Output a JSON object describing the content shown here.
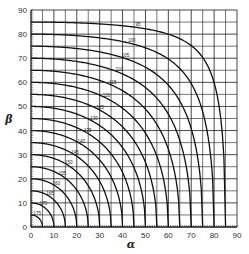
{
  "chart_data": {
    "type": "line",
    "title": "",
    "xlabel": "α",
    "ylabel": "β",
    "xlim": [
      0,
      90
    ],
    "ylim": [
      0,
      90
    ],
    "grid": true,
    "grid_step": 5,
    "x_ticks": [
      0,
      10,
      20,
      30,
      40,
      50,
      60,
      70,
      80,
      90
    ],
    "y_ticks": [
      0,
      10,
      20,
      30,
      40,
      50,
      60,
      70,
      80,
      90
    ],
    "x_tick_labels": [
      "0",
      "10",
      "20",
      "30",
      "40",
      "50",
      "60",
      "70",
      "80",
      "90"
    ],
    "y_tick_labels": [
      "0",
      "10",
      "20",
      "30",
      "40",
      "50",
      "60",
      "70",
      "80",
      "90"
    ],
    "relation": "cos(α)·cos(β) = cos(180° − θ)",
    "series": [
      {
        "name": "175",
        "intercept": 5
      },
      {
        "name": "170",
        "intercept": 10
      },
      {
        "name": "165",
        "intercept": 15
      },
      {
        "name": "160",
        "intercept": 20
      },
      {
        "name": "155",
        "intercept": 25
      },
      {
        "name": "150",
        "intercept": 30
      },
      {
        "name": "145",
        "intercept": 35
      },
      {
        "name": "140",
        "intercept": 40
      },
      {
        "name": "135",
        "intercept": 45
      },
      {
        "name": "130",
        "intercept": 50
      },
      {
        "name": "125",
        "intercept": 55
      },
      {
        "name": "120",
        "intercept": 60
      },
      {
        "name": "115",
        "intercept": 65
      },
      {
        "name": "110",
        "intercept": 70
      },
      {
        "name": "105",
        "intercept": 75
      },
      {
        "name": "100",
        "intercept": 80
      },
      {
        "name": "95",
        "intercept": 85
      }
    ]
  },
  "axes": {
    "x_label": "α",
    "y_label": "β"
  }
}
